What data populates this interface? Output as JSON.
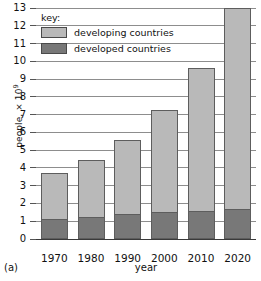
{
  "caption": "(a)",
  "legend": {
    "title": "key:",
    "entries": [
      {
        "label": "developing countries",
        "color": "#b9b9b9"
      },
      {
        "label": "developed countries",
        "color": "#787878"
      }
    ]
  },
  "axes": {
    "ylabel_text": "people, × 10",
    "ylabel_exponent": "9",
    "xlabel": "year",
    "yticks": [
      "0",
      "1",
      "2",
      "3",
      "4",
      "5",
      "6",
      "7",
      "8",
      "9",
      "10",
      "11",
      "12",
      "13"
    ]
  },
  "chart_data": {
    "type": "bar",
    "stacked": true,
    "title": "",
    "xlabel": "year",
    "ylabel": "people, × 10^9",
    "ylim": [
      0,
      13
    ],
    "ytick_step": 1,
    "grid": true,
    "legend_position": "top-left-inside",
    "categories": [
      "1970",
      "1980",
      "1990",
      "2000",
      "2010",
      "2020"
    ],
    "series": [
      {
        "name": "developed countries",
        "color": "#787878",
        "values": [
          1.15,
          1.25,
          1.4,
          1.5,
          1.6,
          1.7
        ]
      },
      {
        "name": "developing countries",
        "color": "#b9b9b9",
        "values": [
          2.55,
          3.2,
          4.2,
          5.75,
          8.05,
          11.3
        ]
      }
    ],
    "totals": [
      3.7,
      4.45,
      5.6,
      7.25,
      9.65,
      13.0
    ]
  }
}
